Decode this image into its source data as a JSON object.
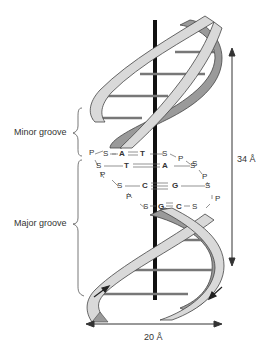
{
  "diagram": {
    "labels": {
      "minor_groove": "Minor groove",
      "major_groove": "Major groove",
      "height": "34 Å",
      "width": "20 Å"
    },
    "base_pairs": [
      {
        "left": "A",
        "right": "T",
        "bond": "double",
        "row": 1
      },
      {
        "left": "T",
        "right": "A",
        "bond": "double",
        "row": 2
      },
      {
        "left": "C",
        "right": "G",
        "bond": "triple",
        "row": 3
      },
      {
        "left": "G",
        "right": "C",
        "bond": "triple",
        "row": 4
      }
    ],
    "backbone_letters": {
      "sugar": "S",
      "phosphate": "P"
    },
    "colors": {
      "strand_fill": "#d9d9d9",
      "strand_dark": "#9a9a9a",
      "strand_outline": "#444444",
      "axis": "#111111",
      "rungs": "#888888"
    }
  }
}
